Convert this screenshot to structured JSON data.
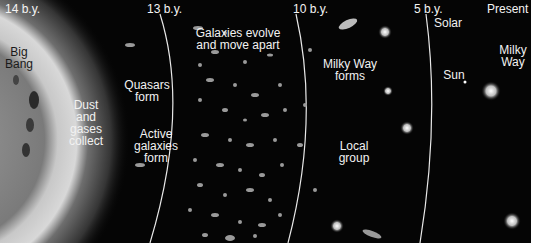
{
  "diagram": {
    "eras": [
      {
        "label": "14 b.y."
      },
      {
        "label": "13 b.y."
      },
      {
        "label": "10 b.y."
      },
      {
        "label": "5 b.y."
      },
      {
        "label": "Present"
      }
    ],
    "annotations": [
      {
        "label": "Big\nBang"
      },
      {
        "label": "Dust\nand\ngases\ncollect"
      },
      {
        "label": "Quasars\nform"
      },
      {
        "label": "Active\ngalaxies\nform"
      },
      {
        "label": "Galaxies evolve\nand move apart"
      },
      {
        "label": "Milky Way\nforms"
      },
      {
        "label": "Local\ngroup"
      },
      {
        "label": "Solar"
      },
      {
        "label": "Sun"
      },
      {
        "label": "Milky\nWay"
      }
    ],
    "colors": {
      "background": "#050505",
      "text": "#f2f2f2",
      "bigbang_text": "#1a1a1a",
      "divider": "#e8e8e8"
    }
  }
}
